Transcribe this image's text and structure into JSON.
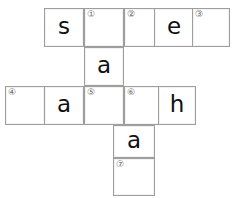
{
  "puzzle": {
    "type": "crossword-grid",
    "grid_columns": 5,
    "grid_rows": 5,
    "border_color": "#9e9e9e",
    "cell_background": "#ffffff",
    "letter_color": "#101010",
    "clue_number_color": "#6b6b6b",
    "cells": [
      {
        "id": "r1c1",
        "row": 1,
        "col": 1,
        "letter": "s",
        "clue": "",
        "x": 44,
        "y": 8,
        "w": 40,
        "h": 39
      },
      {
        "id": "r1c2",
        "row": 1,
        "col": 2,
        "letter": "",
        "clue": "①",
        "x": 84,
        "y": 8,
        "w": 40,
        "h": 39
      },
      {
        "id": "r1c3",
        "row": 1,
        "col": 3,
        "letter": "",
        "clue": "②",
        "x": 124,
        "y": 8,
        "w": 40,
        "h": 39
      },
      {
        "id": "r1c4",
        "row": 1,
        "col": 4,
        "letter": "e",
        "clue": "",
        "x": 154,
        "y": 8,
        "w": 40,
        "h": 39
      },
      {
        "id": "r1c5",
        "row": 1,
        "col": 5,
        "letter": "",
        "clue": "③",
        "x": 192,
        "y": 8,
        "w": 38,
        "h": 39
      },
      {
        "id": "r2c2",
        "row": 2,
        "col": 2,
        "letter": "a",
        "clue": "",
        "x": 84,
        "y": 47,
        "w": 40,
        "h": 39
      },
      {
        "id": "r3c0",
        "row": 3,
        "col": 0,
        "letter": "",
        "clue": "④",
        "x": 5,
        "y": 86,
        "w": 40,
        "h": 39
      },
      {
        "id": "r3c1",
        "row": 3,
        "col": 1,
        "letter": "a",
        "clue": "",
        "x": 44,
        "y": 86,
        "w": 40,
        "h": 39
      },
      {
        "id": "r3c2",
        "row": 3,
        "col": 2,
        "letter": "",
        "clue": "⑤",
        "x": 84,
        "y": 86,
        "w": 40,
        "h": 39
      },
      {
        "id": "r3c3",
        "row": 3,
        "col": 3,
        "letter": "",
        "clue": "⑥",
        "x": 124,
        "y": 86,
        "w": 40,
        "h": 39
      },
      {
        "id": "r3c4",
        "row": 3,
        "col": 4,
        "letter": "h",
        "clue": "",
        "x": 158,
        "y": 86,
        "w": 38,
        "h": 39
      },
      {
        "id": "r4c3",
        "row": 4,
        "col": 3,
        "letter": "a",
        "clue": "",
        "x": 113,
        "y": 125,
        "w": 42,
        "h": 33
      },
      {
        "id": "r5c3",
        "row": 5,
        "col": 3,
        "letter": "",
        "clue": "⑦",
        "x": 113,
        "y": 158,
        "w": 42,
        "h": 38
      }
    ]
  }
}
